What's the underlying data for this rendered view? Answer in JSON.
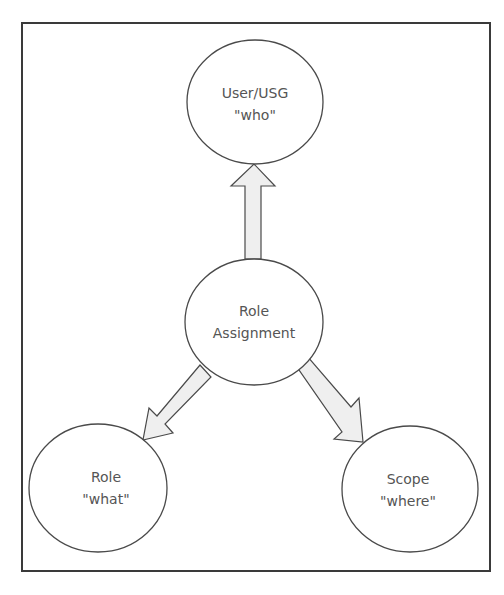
{
  "diagram": {
    "frame": {
      "x": 22,
      "y": 23,
      "width": 468,
      "height": 548
    },
    "nodes": [
      {
        "id": "user",
        "line1": "User/USG",
        "line2": "\"who\"",
        "cx": 255,
        "cy": 102,
        "rx": 68,
        "ry": 62
      },
      {
        "id": "role-assignment",
        "line1": "Role",
        "line2": "Assignment",
        "cx": 254,
        "cy": 322,
        "rx": 69,
        "ry": 63
      },
      {
        "id": "role",
        "line1": "Role",
        "line2": "\"what\"",
        "cx": 98,
        "cy": 488,
        "rx": 69,
        "ry": 64
      },
      {
        "id": "scope",
        "line1": "Scope",
        "line2": "\"where\"",
        "cx": 410,
        "cy": 489,
        "rx": 68,
        "ry": 63
      }
    ],
    "edges": [
      {
        "from": "role-assignment",
        "to": "user",
        "style": "block-arrow"
      },
      {
        "from": "role-assignment",
        "to": "role",
        "style": "block-arrow"
      },
      {
        "from": "role-assignment",
        "to": "scope",
        "style": "block-arrow"
      }
    ],
    "colors": {
      "stroke": "#4a4a4a",
      "arrow_fill": "#efefef",
      "text": "#555555",
      "background": "#ffffff"
    }
  }
}
